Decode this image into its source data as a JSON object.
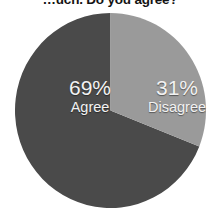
{
  "chart_data": {
    "type": "pie",
    "title": "…uch. Do you agree?",
    "xlabel": "",
    "ylabel": "",
    "categories": [
      "Agree",
      "Disagree"
    ],
    "values": [
      69,
      31
    ],
    "value_suffix": "%",
    "labels": [
      "69%",
      "31%"
    ],
    "legend_position": "none",
    "grid": false,
    "start_angle_deg": 0,
    "direction": "clockwise",
    "series": [
      {
        "name": "Response share",
        "values": [
          69,
          31
        ]
      }
    ],
    "slices": [
      {
        "name": "Agree",
        "value": 69,
        "label": "69%",
        "color": "#4a4a4a",
        "text_color": "#f2f2f2",
        "start_deg": 111.6,
        "sweep_deg": 248.4
      },
      {
        "name": "Disagree",
        "value": 31,
        "label": "31%",
        "color": "#9a9a9a",
        "text_color": "#f2f2f2",
        "start_deg": 0,
        "sweep_deg": 111.6
      }
    ]
  },
  "title": {
    "text": "…uch. Do you agree?"
  },
  "pie": {
    "agree": {
      "percent": "69%",
      "name": "Agree"
    },
    "disagree": {
      "percent": "31%",
      "name": "Disagree"
    }
  },
  "colors": {
    "agree": "#4a4a4a",
    "disagree": "#9a9a9a",
    "background": "#ffffff",
    "label_text": "#f2f2f2",
    "title_text": "#141414"
  }
}
